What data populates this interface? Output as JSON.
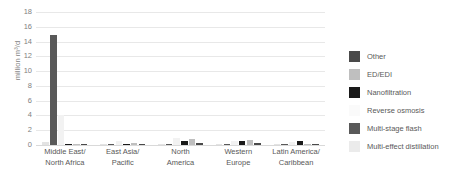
{
  "chart_data": {
    "type": "bar",
    "title": "",
    "xlabel": "",
    "ylabel": "million m³/d",
    "ylim": [
      0,
      18
    ],
    "ytick_step": 2,
    "yticks": [
      18,
      16,
      14,
      12,
      10,
      8,
      6,
      4,
      2,
      0
    ],
    "grid": true,
    "legend_position": "right",
    "categories": [
      "Middle East/\nNorth Africa",
      "East Asia/\nPacific",
      "North\nAmerica",
      "Western\nEurope",
      "Latin America/\nCaribbean"
    ],
    "series": [
      {
        "name": "Multi-effect distillation",
        "color": "#e3e3e3",
        "values": [
          0.35,
          0.12,
          0.05,
          0.08,
          0.04
        ]
      },
      {
        "name": "Multi-stage flash",
        "color": "#595959",
        "values": [
          14.9,
          0.18,
          0.1,
          0.12,
          0.05
        ]
      },
      {
        "name": "Reverse osmosis",
        "color": "#f2f2f2",
        "values": [
          4.0,
          0.55,
          0.95,
          0.6,
          0.35
        ]
      },
      {
        "name": "Nanofiltration",
        "color": "#1a1a1a",
        "values": [
          0.1,
          0.06,
          0.55,
          0.5,
          0.6
        ]
      },
      {
        "name": "ED/EDI",
        "color": "#bfbfbf",
        "values": [
          0.12,
          0.3,
          0.75,
          0.62,
          0.18
        ]
      },
      {
        "name": "Other",
        "color": "#4a4a4a",
        "values": [
          0.2,
          0.2,
          0.28,
          0.22,
          0.12
        ]
      }
    ]
  },
  "legend": {
    "items": [
      {
        "label": "Other",
        "color": "#4a4a4a"
      },
      {
        "label": "ED/EDI",
        "color": "#bfbfbf"
      },
      {
        "label": "Nanofiltration",
        "color": "#1a1a1a"
      },
      {
        "label": "Reverse osmosis",
        "color": "#fafafa"
      },
      {
        "label": "Multi-stage flash",
        "color": "#595959"
      },
      {
        "label": "Multi-effect distillation",
        "color": "#ebebeb"
      }
    ]
  }
}
